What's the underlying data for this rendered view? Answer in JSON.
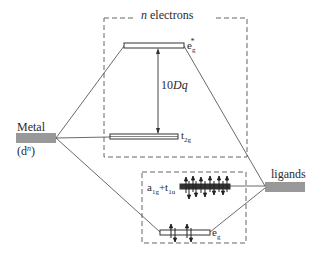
{
  "diagram": {
    "top_box_label": "n electrons",
    "top_box_label_italic": "n",
    "top_box_label_rest": " electrons",
    "metal": {
      "label": "Metal",
      "config": "(d",
      "config_sup": "n",
      "config_close": ")"
    },
    "ligands": {
      "label": "ligands"
    },
    "levels": {
      "eg_star": {
        "base": "e",
        "sub": "g",
        "sup": "*"
      },
      "t2g": {
        "base": "t",
        "sub": "2g"
      },
      "a1g_t1u": {
        "a": "a",
        "a_sub": "1g",
        "plus": "+",
        "t": "t",
        "t_sub": "1u"
      },
      "eg": {
        "base": "e",
        "sub": "g"
      }
    },
    "splitting": {
      "value": "10",
      "symbol": "Dq"
    },
    "colors": {
      "line": "#333333",
      "dashed": "#666666",
      "level_fill": "#ffffff"
    }
  }
}
